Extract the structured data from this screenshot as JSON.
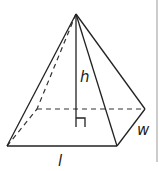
{
  "figure": {
    "type": "rectangular pyramid",
    "labels": {
      "height": "h",
      "length": "l",
      "width": "w"
    },
    "colors": {
      "stroke": "#222222",
      "background": "#ffffff",
      "border": "#999999"
    }
  }
}
